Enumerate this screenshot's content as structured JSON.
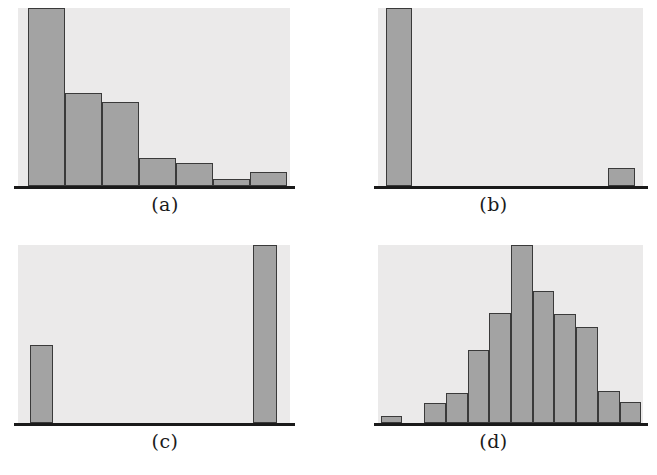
{
  "figure": {
    "background_color": "#ffffff",
    "panel_background_color": "#ebeaea",
    "bar_fill_color": "#a3a3a3",
    "bar_edge_color": "#3a3a3a",
    "baseline_color": "#1a1a1a",
    "panel_count": 4,
    "grid": "2x2"
  },
  "chart_data": [
    {
      "type": "bar",
      "id": "panel-a",
      "title": "",
      "caption": "(a)",
      "shape": "right-skewed",
      "xlabel": "",
      "ylabel": "",
      "grid": false,
      "legend": "none",
      "axis_visible": "baseline-only",
      "ylim": [
        0,
        100
      ],
      "categories": [
        "1",
        "2",
        "3",
        "4",
        "5",
        "6",
        "7"
      ],
      "values": [
        100,
        52,
        47,
        16,
        13,
        4,
        8
      ],
      "bar_geometry": [
        {
          "x_pct": 3.7,
          "w_pct": 13.6,
          "h_pct": 100
        },
        {
          "x_pct": 17.3,
          "w_pct": 13.6,
          "h_pct": 52
        },
        {
          "x_pct": 30.9,
          "w_pct": 13.6,
          "h_pct": 47
        },
        {
          "x_pct": 44.5,
          "w_pct": 13.6,
          "h_pct": 16
        },
        {
          "x_pct": 58.1,
          "w_pct": 13.6,
          "h_pct": 13
        },
        {
          "x_pct": 71.7,
          "w_pct": 13.6,
          "h_pct": 4
        },
        {
          "x_pct": 85.3,
          "w_pct": 13.6,
          "h_pct": 8
        }
      ]
    },
    {
      "type": "bar",
      "id": "panel-b",
      "title": "",
      "caption": "(b)",
      "shape": "extreme-outlier",
      "xlabel": "",
      "ylabel": "",
      "grid": false,
      "legend": "none",
      "axis_visible": "baseline-only",
      "ylim": [
        0,
        100
      ],
      "categories": [
        "1",
        "2",
        "3",
        "4",
        "5",
        "6",
        "7",
        "8",
        "9",
        "10"
      ],
      "values": [
        100,
        0,
        0,
        0,
        0,
        0,
        0,
        0,
        0,
        10
      ],
      "bar_geometry": [
        {
          "x_pct": 3.0,
          "w_pct": 10.0,
          "h_pct": 100
        },
        {
          "x_pct": 86.8,
          "w_pct": 10.0,
          "h_pct": 10
        }
      ]
    },
    {
      "type": "bar",
      "id": "panel-c",
      "title": "",
      "caption": "(c)",
      "shape": "bimodal",
      "xlabel": "",
      "ylabel": "",
      "grid": false,
      "legend": "none",
      "axis_visible": "baseline-only",
      "ylim": [
        0,
        100
      ],
      "categories": [
        "1",
        "2",
        "3",
        "4",
        "5",
        "6",
        "7",
        "8",
        "9",
        "10"
      ],
      "values": [
        44,
        0,
        0,
        0,
        0,
        0,
        0,
        0,
        0,
        100
      ],
      "bar_geometry": [
        {
          "x_pct": 4.5,
          "w_pct": 8.3,
          "h_pct": 44
        },
        {
          "x_pct": 86.5,
          "w_pct": 8.8,
          "h_pct": 100
        }
      ]
    },
    {
      "type": "bar",
      "id": "panel-d",
      "title": "",
      "caption": "(d)",
      "shape": "bell-shaped",
      "xlabel": "",
      "ylabel": "",
      "grid": false,
      "legend": "none",
      "axis_visible": "baseline-only",
      "ylim": [
        0,
        100
      ],
      "categories": [
        "1",
        "2",
        "3",
        "4",
        "5",
        "6",
        "7",
        "8",
        "9",
        "10",
        "11",
        "12"
      ],
      "values": [
        4,
        0,
        11,
        17,
        41,
        62,
        100,
        74,
        61,
        54,
        18,
        12
      ],
      "bar_geometry": [
        {
          "x_pct": 1.0,
          "w_pct": 8.2,
          "h_pct": 4
        },
        {
          "x_pct": 9.2,
          "w_pct": 8.2,
          "h_pct": 0
        },
        {
          "x_pct": 17.4,
          "w_pct": 8.2,
          "h_pct": 11
        },
        {
          "x_pct": 25.6,
          "w_pct": 8.2,
          "h_pct": 17
        },
        {
          "x_pct": 33.8,
          "w_pct": 8.2,
          "h_pct": 41
        },
        {
          "x_pct": 42.0,
          "w_pct": 8.2,
          "h_pct": 62
        },
        {
          "x_pct": 50.2,
          "w_pct": 8.2,
          "h_pct": 100
        },
        {
          "x_pct": 58.4,
          "w_pct": 8.2,
          "h_pct": 74
        },
        {
          "x_pct": 66.6,
          "w_pct": 8.2,
          "h_pct": 61
        },
        {
          "x_pct": 74.8,
          "w_pct": 8.2,
          "h_pct": 54
        },
        {
          "x_pct": 83.0,
          "w_pct": 8.2,
          "h_pct": 18
        },
        {
          "x_pct": 91.2,
          "w_pct": 8.2,
          "h_pct": 12
        }
      ]
    }
  ]
}
